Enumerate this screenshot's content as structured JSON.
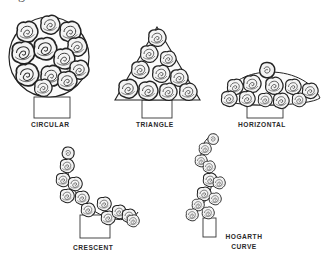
{
  "caption_fragment": "igure",
  "arrangements": [
    {
      "id": "circular",
      "label": "CIRCULAR"
    },
    {
      "id": "triangle",
      "label": "TRIANGLE"
    },
    {
      "id": "horizontal",
      "label": "HORIZONTAL"
    },
    {
      "id": "crescent",
      "label": "CRESCENT"
    },
    {
      "id": "hogarth",
      "label_line1": "HOGARTH",
      "label_line2": "CURVE"
    }
  ],
  "colors": {
    "background": "#ffffff",
    "ink": "#2a2a2a",
    "rose_fill": "#f4f4f4"
  }
}
